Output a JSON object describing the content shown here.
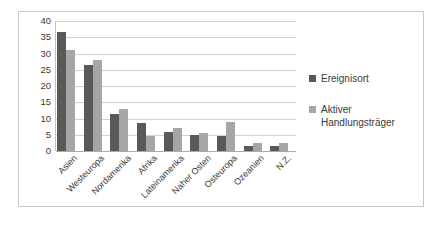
{
  "chart_data": {
    "type": "bar",
    "title": "",
    "xlabel": "",
    "ylabel": "",
    "ylim": [
      0,
      40
    ],
    "yticks": [
      0,
      5,
      10,
      15,
      20,
      25,
      30,
      35,
      40
    ],
    "grid": true,
    "legend_position": "right",
    "categories": [
      "Asien",
      "Westeuropa",
      "Nordamerika",
      "Afrika",
      "Lateinamerika",
      "Naher Osten",
      "Osteuropa",
      "Ozeanien",
      "N.Z."
    ],
    "series": [
      {
        "name": "Ereignisort",
        "color": "#595959",
        "values": [
          36.5,
          26.5,
          11.5,
          8.5,
          6.0,
          5.0,
          4.5,
          1.5,
          1.5
        ]
      },
      {
        "name": "Aktiver Handlungsträger",
        "color": "#a6a6a6",
        "values": [
          31.0,
          28.0,
          13.0,
          4.5,
          7.0,
          5.5,
          9.0,
          2.5,
          2.5
        ]
      }
    ]
  },
  "legend": {
    "items": [
      {
        "label": "Ereignisort",
        "color": "#595959"
      },
      {
        "label": "Aktiver Handlungsträger",
        "color": "#a6a6a6"
      }
    ]
  }
}
